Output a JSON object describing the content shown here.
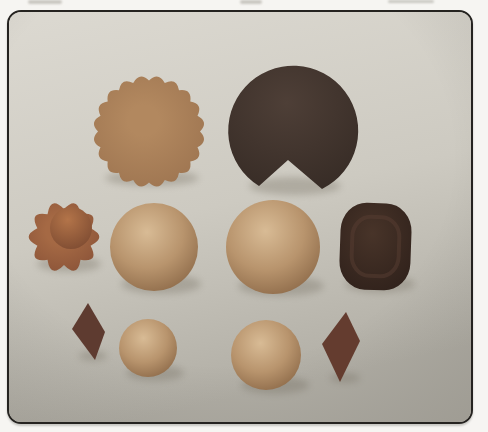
{
  "figure": {
    "type": "photograph",
    "objects": [
      {
        "id": "scalloped-disc",
        "label": "large flat scalloped circle, tan-orange",
        "row": "top"
      },
      {
        "id": "notched-circle",
        "label": "large dark brown circle with a wedge notch cut from its bottom edge",
        "row": "top"
      },
      {
        "id": "flower",
        "label": "small scalloped flower with raised domed center, rust-orange",
        "row": "middle"
      },
      {
        "id": "sphere-middle-left",
        "label": "large tan clay ball",
        "row": "middle"
      },
      {
        "id": "sphere-middle-center",
        "label": "large tan clay ball, slightly lighter",
        "row": "middle"
      },
      {
        "id": "dark-lump",
        "label": "dark brown rounded square lump with inner ridge",
        "row": "middle"
      },
      {
        "id": "diamond-left",
        "label": "small dark maroon diamond (rhombus)",
        "row": "bottom"
      },
      {
        "id": "sphere-bottom-left",
        "label": "small tan clay ball",
        "row": "bottom"
      },
      {
        "id": "sphere-bottom-center",
        "label": "small tan clay ball, slightly larger",
        "row": "bottom"
      },
      {
        "id": "diamond-right",
        "label": "small dark maroon diamond (rhombus), larger",
        "row": "bottom"
      }
    ]
  },
  "palette": {
    "page_bg": "#f6f5f2",
    "frame_border": "#252320",
    "bg_top": "#dcd9d1",
    "bg_mid": "#cdcac1",
    "bg_bottom": "#b1aea5",
    "disc_hi": "#b2885f",
    "disc_lo": "#9d7450",
    "pac_hi": "#4e3f37",
    "pac_lo": "#362b25",
    "petal_hi": "#a56944",
    "petal_lo": "#8a5338",
    "dome_hi": "#b37449",
    "dome_lo": "#7c4a31",
    "sphere_hi": "#d8bb95",
    "sphere_mid": "#b8946d",
    "sphere_lo": "#8c6948",
    "lump_hi": "#483429",
    "lump_lo": "#2e201a",
    "lump_ridge": "#54var3c31",
    "ridge": "#553d31",
    "diamond_left_fill": "#5e3b30",
    "diamond_right_fill": "#643c2f",
    "shadow": "#6f695c"
  },
  "geometry": {
    "scalloped_disc": {
      "cx": 140,
      "cy": 119.5,
      "r": 51,
      "bumps": 20,
      "amp": 5
    },
    "flower_petals": {
      "cx": 55,
      "cy": 225,
      "r": 28,
      "bumps": 10,
      "amp": 8
    }
  }
}
